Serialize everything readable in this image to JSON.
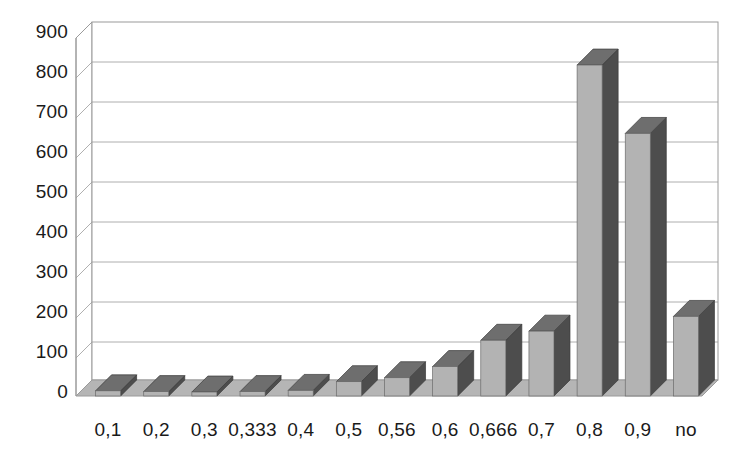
{
  "chart_data": {
    "type": "bar",
    "title": "",
    "subtitle": "",
    "xlabel": "",
    "ylabel": "",
    "style": "3d-column",
    "grid": true,
    "legend": false,
    "legend_position": "none",
    "decimal_separator": ",",
    "ylim": [
      0,
      900
    ],
    "ytick_step": 100,
    "ytick_labels": [
      "900",
      "800",
      "700",
      "600",
      "500",
      "400",
      "300",
      "200",
      "100",
      "0"
    ],
    "ytick_values": [
      900,
      800,
      700,
      600,
      500,
      400,
      300,
      200,
      100,
      0
    ],
    "categories": [
      "0,1",
      "0,2",
      "0,3",
      "0,333",
      "0,4",
      "0,5",
      "0,56",
      "0,6",
      "0,666",
      "0,7",
      "0,8",
      "0,9",
      "no"
    ],
    "values": [
      13,
      11,
      10,
      11,
      14,
      36,
      46,
      74,
      140,
      163,
      832,
      660,
      200
    ],
    "series": [
      {
        "name": "",
        "values": [
          13,
          11,
          10,
          11,
          14,
          36,
          46,
          74,
          140,
          163,
          832,
          660,
          200
        ]
      }
    ],
    "colors": {
      "bar_front": "#b3b3b3",
      "bar_side": "#4d4d4d",
      "bar_top": "#6e6e6e",
      "floor": "#b5b5b5",
      "wall": "#ffffff",
      "gridline": "#9a9a9a",
      "axis_line": "#808080",
      "text": "#1a1a1a"
    }
  }
}
